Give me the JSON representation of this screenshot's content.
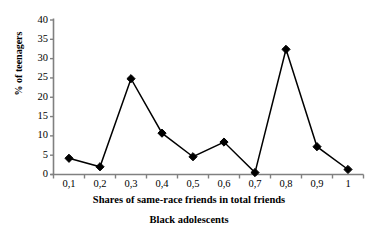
{
  "chart_data": {
    "type": "line",
    "title": "",
    "subtitle": "Black adolescents",
    "xlabel": "Shares of same-race friends in total friends",
    "ylabel": "% of teenagers",
    "categories": [
      "0,1",
      "0,2",
      "0,3",
      "0,4",
      "0,5",
      "0,6",
      "0,7",
      "0,8",
      "0,9",
      "1"
    ],
    "x": [
      0.1,
      0.2,
      0.3,
      0.4,
      0.5,
      0.6,
      0.7,
      0.8,
      0.9,
      1.0
    ],
    "values": [
      4.2,
      2.0,
      24.8,
      10.7,
      4.6,
      8.4,
      0.5,
      32.4,
      7.2,
      1.3
    ],
    "series": [
      {
        "name": "Black adolescents",
        "values": [
          4.2,
          2.0,
          24.8,
          10.7,
          4.6,
          8.4,
          0.5,
          32.4,
          7.2,
          1.3
        ]
      }
    ],
    "ylim": [
      0,
      40
    ],
    "yticks": [
      0,
      5,
      10,
      15,
      20,
      25,
      30,
      35,
      40
    ],
    "ytick_labels": [
      "0",
      "5",
      "10",
      "15",
      "20",
      "25",
      "30",
      "35",
      "40"
    ],
    "grid": false,
    "legend": "none",
    "marker": "diamond",
    "line_color": "#000000",
    "marker_color": "#000000",
    "axis_color": "#808080",
    "background_color": "#ffffff"
  }
}
